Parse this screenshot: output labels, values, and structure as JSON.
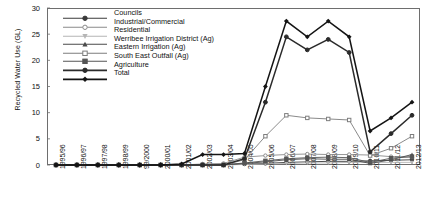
{
  "chart_data": {
    "type": "line",
    "title": "",
    "xlabel": "",
    "ylabel": "Recycled Water Use (GL)",
    "ylim": [
      0,
      30
    ],
    "yticks": [
      0,
      5,
      10,
      15,
      20,
      25,
      30
    ],
    "grid": false,
    "legend_position": "top-left-inside",
    "categories": [
      "1995/96",
      "1996/97",
      "1997/98",
      "1998/99",
      "99/2000",
      "2000/01",
      "2001/02",
      "2002/03",
      "2003/04",
      "2004/05",
      "2005/06",
      "2006/07",
      "2007/08",
      "2008/09",
      "2009/10",
      "2010/11",
      "2011/12",
      "2012/13"
    ],
    "series": [
      {
        "name": "Councils",
        "marker": "circle",
        "color": "#3a3a3a",
        "values": [
          0,
          0,
          0,
          0,
          0,
          0,
          0,
          0.1,
          0.1,
          0.2,
          0.3,
          0.5,
          0.6,
          0.7,
          0.7,
          0.8,
          0.9,
          1.0
        ]
      },
      {
        "name": "Industrial/Commercial",
        "marker": "circle-open",
        "color": "#8a8a8a",
        "values": [
          0,
          0,
          0,
          0,
          0,
          0,
          0,
          0.2,
          0.3,
          1.5,
          1.8,
          2.0,
          2.1,
          2.0,
          2.0,
          1.9,
          1.6,
          1.5
        ]
      },
      {
        "name": "Residential",
        "marker": "triangle-down",
        "color": "#b5b5b5",
        "values": [
          0,
          0,
          0,
          0,
          0,
          0,
          0,
          0,
          0,
          0.1,
          0.2,
          0.3,
          0.4,
          0.4,
          0.5,
          0.5,
          0.5,
          0.5
        ]
      },
      {
        "name": "Werribee Irrigation District (Ag)",
        "marker": "triangle-up",
        "color": "#4a4a4a",
        "values": [
          0,
          0,
          0,
          0,
          0,
          0,
          0,
          0,
          0,
          0.3,
          0.6,
          1.0,
          1.2,
          1.1,
          1.1,
          0.3,
          1.0,
          2.0
        ]
      },
      {
        "name": "Eastern Irrigation (Ag)",
        "marker": "square-open",
        "color": "#7d7d7d",
        "values": [
          0,
          0,
          0,
          0,
          0,
          0,
          0,
          0,
          0,
          1.0,
          5.5,
          9.5,
          9.0,
          8.8,
          8.6,
          1.8,
          3.2,
          5.5
        ]
      },
      {
        "name": "South East Outfall (Ag)",
        "marker": "square",
        "color": "#555555",
        "values": [
          0,
          0,
          0,
          0,
          0,
          0,
          0,
          0,
          0,
          0.4,
          0.8,
          1.2,
          1.4,
          1.5,
          1.4,
          0.5,
          1.3,
          1.6
        ]
      },
      {
        "name": "Agriculture",
        "marker": "circle",
        "color": "#2b2b2b",
        "values": [
          0,
          0,
          0,
          0,
          0,
          0,
          0,
          0,
          0,
          1.2,
          12.0,
          24.5,
          22.0,
          24.0,
          21.5,
          2.5,
          6.0,
          9.5
        ]
      },
      {
        "name": "Total",
        "marker": "diamond",
        "color": "#141414",
        "values": [
          0,
          0,
          0,
          0,
          0,
          0,
          0.2,
          2.0,
          2.0,
          2.2,
          15.0,
          27.5,
          24.5,
          27.5,
          24.5,
          6.5,
          9.0,
          12.0
        ]
      }
    ]
  }
}
